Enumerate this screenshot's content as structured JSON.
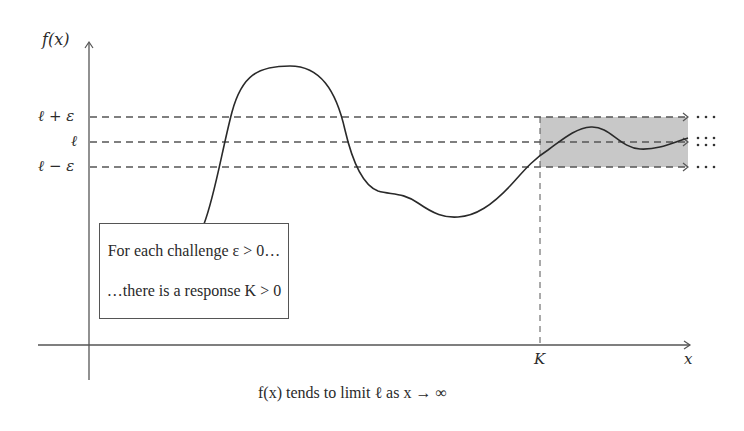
{
  "diagram": {
    "y_axis_label": "f(x)",
    "x_axis_label": "x",
    "y_ticks": [
      {
        "label": "ℓ + ε",
        "y": 117
      },
      {
        "label": "ℓ",
        "y": 142
      },
      {
        "label": "ℓ − ε",
        "y": 167
      }
    ],
    "x_ticks": [
      {
        "label": "K",
        "x": 540
      }
    ],
    "callout": {
      "line1": "For each challenge ε > 0…",
      "line2": "…there is a response K > 0"
    },
    "continuation_marks": [
      "⋯",
      "⁝⁝",
      "⋯"
    ],
    "caption": "f(x) tends to limit ℓ as x → ∞",
    "colors": {
      "band": "#c8c8c8",
      "axis": "#555555",
      "curve": "#2a2a2a"
    }
  }
}
